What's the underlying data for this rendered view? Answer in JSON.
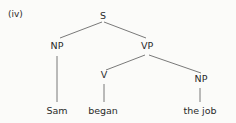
{
  "example_label": "(iv)",
  "tree": {
    "root": "S",
    "np_subject": "NP",
    "vp": "VP",
    "verb": "V",
    "np_object": "NP",
    "leaves": {
      "subject": "Sam",
      "verb": "began",
      "object": "the job"
    }
  },
  "colors": {
    "line": "#666666",
    "text": "#2a2a2a",
    "background": "#fbfbf9"
  }
}
